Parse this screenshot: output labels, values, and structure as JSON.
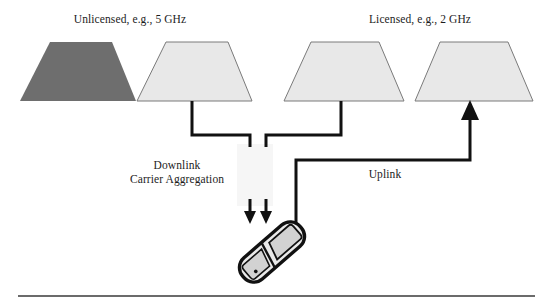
{
  "figure": {
    "background_color": "#ffffff",
    "width": 550,
    "height": 303
  },
  "labels": {
    "unlicensed": "Unlicensed, e.g., 5 GHz",
    "licensed": "Licensed, e.g., 2 GHz",
    "downlink_line1": "Downlink",
    "downlink_line2": "Carrier Aggregation",
    "downlink_full": "Downlink Carrier Aggregation",
    "uplink": "Uplink"
  },
  "colors": {
    "ink": "#1c1c1c",
    "line": "#111111",
    "cell_dark_fill": "#6e6e6e",
    "cell_light_fill": "#e8e8e8",
    "cell_stroke": "#7a7a7a",
    "phone_body": "#e9e9e9",
    "phone_panel": "#d2d2d2",
    "phone_outline": "#111111",
    "rule": "#444444",
    "smudge": "#f5f5f5"
  },
  "cells": [
    {
      "name": "unlicensed-dark-cell",
      "band": "Unlicensed, e.g., 5 GHz",
      "fill": "#6e6e6e",
      "shade": "dark",
      "has_downlink": false
    },
    {
      "name": "unlicensed-light-cell",
      "band": "Unlicensed, e.g., 5 GHz",
      "fill": "#e8e8e8",
      "shade": "light",
      "has_downlink": true
    },
    {
      "name": "licensed-downlink-cell",
      "band": "Licensed, e.g., 2 GHz",
      "fill": "#e8e8e8",
      "shade": "light",
      "has_downlink": true
    },
    {
      "name": "licensed-uplink-cell",
      "band": "Licensed, e.g., 2 GHz",
      "fill": "#e8e8e8",
      "shade": "light",
      "has_downlink": false
    }
  ],
  "links": [
    {
      "name": "downlink-unlicensed",
      "label": "Downlink Carrier Aggregation",
      "from": "unlicensed-light-cell",
      "to": "mobile-device",
      "direction": "down"
    },
    {
      "name": "downlink-licensed",
      "label": "Downlink Carrier Aggregation",
      "from": "licensed-downlink-cell",
      "to": "mobile-device",
      "direction": "down"
    },
    {
      "name": "uplink-licensed",
      "label": "Uplink",
      "from": "mobile-device",
      "to": "licensed-uplink-cell",
      "direction": "up"
    }
  ],
  "device": {
    "name": "mobile-device",
    "type": "flip-phone"
  },
  "footer": {
    "rule": true
  }
}
